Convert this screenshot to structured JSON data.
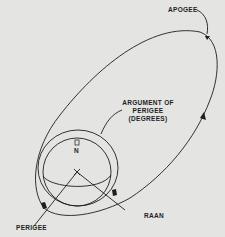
{
  "diagram": {
    "type": "orbital-elements",
    "labels": {
      "apogee": "APOGEE",
      "argument_line1": "ARGUMENT OF",
      "argument_line2": "PERIGEE",
      "argument_line3": "(DEGREES)",
      "north": "N",
      "raan": "RAAN",
      "perigee": "PERIGEE"
    },
    "colors": {
      "background": "#e4e4e2",
      "ink": "#1e1e1e"
    }
  }
}
